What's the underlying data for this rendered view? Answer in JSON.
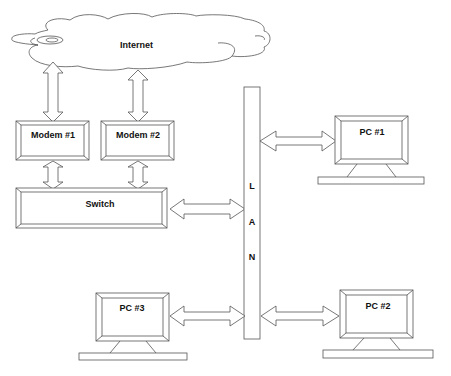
{
  "diagram": {
    "colors": {
      "stroke": "#555555",
      "text": "#111111",
      "fill": "#ffffff"
    },
    "cloud": {
      "label": "Internet"
    },
    "modems": [
      {
        "label": "Modem #1"
      },
      {
        "label": "Modem #2"
      }
    ],
    "switch": {
      "label": "Switch"
    },
    "lan": {
      "letters": [
        "L",
        "A",
        "N"
      ]
    },
    "pcs": [
      {
        "label": "PC #1"
      },
      {
        "label": "PC #2"
      },
      {
        "label": "PC #3"
      }
    ],
    "connections": [
      {
        "from": "Internet",
        "to": "Modem #1",
        "type": "double-arrow"
      },
      {
        "from": "Internet",
        "to": "Modem #2",
        "type": "double-arrow"
      },
      {
        "from": "Modem #1",
        "to": "Switch",
        "type": "double-arrow"
      },
      {
        "from": "Modem #2",
        "to": "Switch",
        "type": "double-arrow"
      },
      {
        "from": "Switch",
        "to": "LAN",
        "type": "double-arrow"
      },
      {
        "from": "LAN",
        "to": "PC #1",
        "type": "double-arrow"
      },
      {
        "from": "LAN",
        "to": "PC #2",
        "type": "double-arrow"
      },
      {
        "from": "PC #3",
        "to": "LAN",
        "type": "double-arrow"
      }
    ]
  }
}
